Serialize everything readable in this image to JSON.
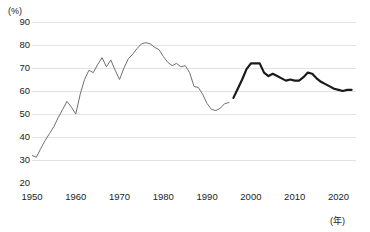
{
  "chart_data": {
    "type": "line",
    "title": "",
    "xlabel": "(年)",
    "ylabel": "(%)",
    "xlim": [
      1950,
      2024
    ],
    "ylim": [
      20,
      90
    ],
    "ytick_labels": [
      "90",
      "80",
      "70",
      "60",
      "50",
      "40",
      "30",
      "20"
    ],
    "ytick_values": [
      90,
      80,
      70,
      60,
      50,
      40,
      30,
      20
    ],
    "xtick_labels": [
      "1950",
      "1960",
      "1970",
      "1980",
      "1990",
      "2000",
      "2010",
      "2020"
    ],
    "xtick_values": [
      1950,
      1960,
      1970,
      1980,
      1990,
      2000,
      2010,
      2020
    ],
    "grid": true,
    "grid_axis": "y",
    "legend": "none",
    "series": [
      {
        "name": "old-series",
        "style": "thin-gray",
        "color": "#6f6f6f",
        "width": 1.0,
        "x": [
          1950,
          1951,
          1952,
          1953,
          1954,
          1955,
          1956,
          1957,
          1958,
          1959,
          1960,
          1961,
          1962,
          1963,
          1964,
          1965,
          1966,
          1967,
          1968,
          1969,
          1970,
          1971,
          1972,
          1973,
          1974,
          1975,
          1976,
          1977,
          1978,
          1979,
          1980,
          1981,
          1982,
          1983,
          1984,
          1985,
          1986,
          1987,
          1988,
          1989,
          1990,
          1991,
          1992,
          1993,
          1994,
          1995
        ],
        "values": [
          32.0,
          31.2,
          35.0,
          38.5,
          41.5,
          44.5,
          48.5,
          52.0,
          55.5,
          53.0,
          50.0,
          58.5,
          65.0,
          69.0,
          68.0,
          71.5,
          74.5,
          70.5,
          73.5,
          69.0,
          65.0,
          70.0,
          74.0,
          76.0,
          78.5,
          80.5,
          81.0,
          80.5,
          79.0,
          78.0,
          75.0,
          72.5,
          71.0,
          72.0,
          70.5,
          71.0,
          68.0,
          62.0,
          61.5,
          58.5,
          54.5,
          52.0,
          51.5,
          52.5,
          54.5,
          55.0
        ]
      },
      {
        "name": "new-series",
        "style": "thick-black",
        "color": "#1a1a1a",
        "width": 2.2,
        "x": [
          1996,
          1997,
          1998,
          1999,
          2000,
          2001,
          2002,
          2003,
          2004,
          2005,
          2006,
          2007,
          2008,
          2009,
          2010,
          2011,
          2012,
          2013,
          2014,
          2015,
          2016,
          2017,
          2018,
          2019,
          2020,
          2021,
          2022,
          2023
        ],
        "values": [
          57.0,
          61.0,
          65.0,
          69.5,
          72.0,
          72.0,
          72.0,
          68.0,
          66.5,
          67.5,
          66.5,
          65.5,
          64.5,
          65.0,
          64.5,
          64.5,
          66.0,
          68.0,
          67.5,
          65.5,
          64.0,
          63.0,
          62.0,
          61.0,
          60.5,
          60.0,
          60.5,
          60.5
        ]
      }
    ]
  }
}
